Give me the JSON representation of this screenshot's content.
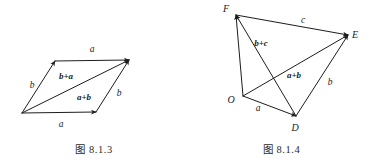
{
  "page": {
    "background_color": "#ffffff",
    "ink_color": "#1d1d1d",
    "width": 375,
    "height": 166
  },
  "figures": [
    {
      "id": "fig-8-1-3",
      "caption": "图 8.1.3",
      "description": "Parallelogram law of vector addition",
      "points": {
        "O": {
          "x": 22,
          "y": 113
        },
        "P": {
          "x": 55,
          "y": 61
        },
        "Q": {
          "x": 129,
          "y": 60
        },
        "R": {
          "x": 96,
          "y": 112
        }
      },
      "vectors": [
        {
          "name": "a-top",
          "label": "a",
          "from": "P",
          "to": "Q",
          "label_x": 92,
          "label_y": 52
        },
        {
          "name": "b-left",
          "label": "b",
          "from": "O",
          "to": "P",
          "label_x": 32,
          "label_y": 88
        },
        {
          "name": "b-right",
          "label": "b",
          "from": "R",
          "to": "Q",
          "label_x": 119,
          "label_y": 96
        },
        {
          "name": "a-bottom",
          "label": "a",
          "from": "O",
          "to": "R",
          "label_x": 61,
          "label_y": 127
        },
        {
          "name": "diagonal-b-plus-a",
          "label": "b+a",
          "from": "O",
          "to": "Q",
          "label_x": 66,
          "label_y": 79
        },
        {
          "name": "diagonal-a-plus-b",
          "label": "a+b",
          "from": "O",
          "to": "Q",
          "label_x": 80,
          "label_y": 100
        }
      ]
    },
    {
      "id": "fig-8-1-4",
      "caption": "图 8.1.4",
      "description": "Associative law of vector addition using quadrilateral ODEF",
      "points": {
        "O": {
          "x": 55,
          "y": 96
        },
        "D": {
          "x": 108,
          "y": 116
        },
        "E": {
          "x": 160,
          "y": 35
        },
        "F": {
          "x": 48,
          "y": 15
        }
      },
      "point_labels": [
        {
          "name": "vertex-label-F",
          "label": "F",
          "x": 38,
          "y": 12
        },
        {
          "name": "vertex-label-E",
          "label": "E",
          "x": 167,
          "y": 37
        },
        {
          "name": "vertex-label-O",
          "label": "O",
          "x": 43,
          "y": 102
        },
        {
          "name": "vertex-label-D",
          "label": "D",
          "x": 106,
          "y": 131
        }
      ],
      "vectors": [
        {
          "name": "vector-a",
          "label": "a",
          "from": "O",
          "to": "D",
          "label_x": 70,
          "label_y": 110
        },
        {
          "name": "vector-b",
          "label": "b",
          "from": "D",
          "to": "E",
          "label_x": 142,
          "label_y": 84
        },
        {
          "name": "vector-c",
          "label": "c",
          "from": "F",
          "to": "E",
          "label_x": 115,
          "label_y": 22
        },
        {
          "name": "vector-a-plus-b",
          "label": "a+b",
          "from": "O",
          "to": "E",
          "label_x": 104,
          "label_y": 77
        },
        {
          "name": "vector-b-plus-c",
          "label": "b+c",
          "from": "D",
          "to": "F",
          "label_x": 72,
          "label_y": 45
        },
        {
          "name": "vector-sum-OF",
          "label": "",
          "from": "O",
          "to": "F",
          "label_x": 0,
          "label_y": 0
        }
      ]
    }
  ]
}
